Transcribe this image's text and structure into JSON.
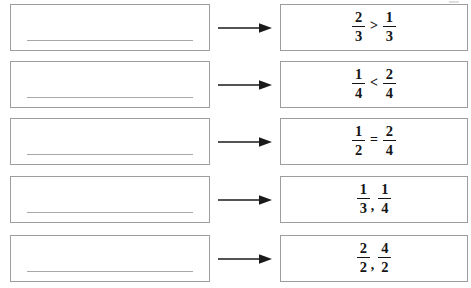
{
  "page": {
    "type": "math-worksheet",
    "border_color": "#9d9d9d",
    "line_color": "#a8a8a8",
    "ink_color": "#151515"
  },
  "arrow": {
    "icon": "arrow-right-icon",
    "direction": "right"
  },
  "rows": [
    {
      "index": 1,
      "answer_value": "",
      "answer_placeholder": "",
      "expression": {
        "left": {
          "numerator": "2",
          "denominator": "3"
        },
        "operator": ">",
        "right": {
          "numerator": "1",
          "denominator": "3"
        }
      }
    },
    {
      "index": 2,
      "answer_value": "",
      "answer_placeholder": "",
      "expression": {
        "left": {
          "numerator": "1",
          "denominator": "4"
        },
        "operator": "<",
        "right": {
          "numerator": "2",
          "denominator": "4"
        }
      }
    },
    {
      "index": 3,
      "answer_value": "",
      "answer_placeholder": "",
      "expression": {
        "left": {
          "numerator": "1",
          "denominator": "2"
        },
        "operator": "=",
        "right": {
          "numerator": "2",
          "denominator": "4"
        }
      }
    },
    {
      "index": 4,
      "answer_value": "",
      "answer_placeholder": "",
      "expression": {
        "left": {
          "numerator": "1",
          "denominator": "3"
        },
        "operator": ",",
        "right": {
          "numerator": "1",
          "denominator": "4"
        }
      }
    },
    {
      "index": 5,
      "answer_value": "",
      "answer_placeholder": "",
      "expression": {
        "left": {
          "numerator": "2",
          "denominator": "2"
        },
        "operator": ",",
        "right": {
          "numerator": "4",
          "denominator": "2"
        }
      }
    }
  ]
}
